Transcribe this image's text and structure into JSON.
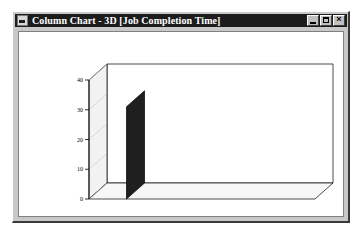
{
  "window": {
    "title": "Column Chart - 3D [Job Completion Time]",
    "icon": "chart-window-icon",
    "buttons": {
      "minimize": "_",
      "maximize": "□",
      "close": "×"
    }
  },
  "chart_data": {
    "type": "bar",
    "title": "",
    "categories": [
      "Job 1",
      "Job 2",
      "Job 3",
      "Job 4",
      "Job 5"
    ],
    "values": [
      31,
      27,
      34,
      22,
      34
    ],
    "xlabel": "Job",
    "ylabel": "Value",
    "ylim": [
      0,
      40
    ],
    "yticks": [
      0,
      10,
      20,
      30,
      40
    ],
    "ytick_labels": [
      "0",
      "10",
      "20",
      "30",
      "40"
    ],
    "grid": false,
    "legend": false,
    "three_d": true,
    "bar_colors": [
      "#2b2b2b",
      "#6e6e6e",
      "#a0a0a0",
      "#454545",
      "#4f4f4f"
    ]
  }
}
